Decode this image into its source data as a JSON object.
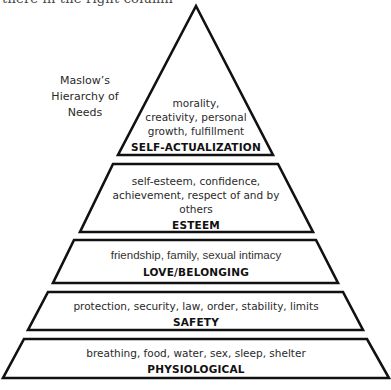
{
  "header_fragment": "there in the right column",
  "side_title": {
    "lines": [
      "Maslow’s",
      "Hierarchy of",
      "Needs"
    ]
  },
  "colors": {
    "stroke": "#111111",
    "fill": "#ffffff",
    "text": "#2a2a2a"
  },
  "tiers": [
    {
      "level": 5,
      "name": "SELF-ACTUALIZATION",
      "description_lines": [
        "morality,",
        "creativity, personal",
        "growth, fulfillment"
      ]
    },
    {
      "level": 4,
      "name": "ESTEEM",
      "description_lines": [
        "self-esteem, confidence,",
        "achievement, respect of and by",
        "others"
      ]
    },
    {
      "level": 3,
      "name": "LOVE/BELONGING",
      "description_lines": [
        "friendship, family, sexual intimacy"
      ]
    },
    {
      "level": 2,
      "name": "SAFETY",
      "description_lines": [
        "protection, security, law, order, stability, limits"
      ]
    },
    {
      "level": 1,
      "name": "PHYSIOLOGICAL",
      "description_lines": [
        "breathing, food, water, sex, sleep, shelter"
      ]
    }
  ]
}
